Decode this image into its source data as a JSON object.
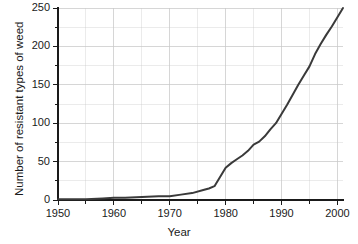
{
  "chart_data": {
    "type": "line",
    "title": "",
    "xlabel": "Year",
    "ylabel": "Number of resistant types of weed",
    "xlim": [
      1950,
      2001
    ],
    "ylim": [
      0,
      250
    ],
    "grid": true,
    "legend": null,
    "x_ticks": [
      1950,
      1960,
      1970,
      1980,
      1990,
      2000
    ],
    "x_tick_labels": [
      "1950",
      "1960",
      "1970",
      "1980",
      "1990",
      "2000"
    ],
    "x_minor_step": 5,
    "y_ticks": [
      0,
      50,
      100,
      150,
      200,
      250
    ],
    "y_tick_labels": [
      "0",
      "50",
      "100",
      "150",
      "200",
      "250"
    ],
    "y_minor_step": 25,
    "series": [
      {
        "name": "Resistant weed types",
        "color": "#3a3a3a",
        "line_width": 2,
        "x": [
          1950,
          1955,
          1958,
          1960,
          1962,
          1965,
          1968,
          1970,
          1972,
          1974,
          1976,
          1977,
          1978,
          1979,
          1980,
          1981,
          1982,
          1983,
          1984,
          1985,
          1986,
          1987,
          1988,
          1989,
          1990,
          1991,
          1992,
          1993,
          1994,
          1995,
          1996,
          1997,
          1998,
          1999,
          2000,
          2001
        ],
        "y": [
          1,
          1,
          2,
          3,
          3,
          4,
          5,
          5,
          7,
          9,
          13,
          15,
          18,
          30,
          42,
          48,
          53,
          58,
          64,
          72,
          76,
          83,
          92,
          100,
          112,
          124,
          137,
          150,
          162,
          174,
          190,
          203,
          215,
          226,
          238,
          250
        ]
      }
    ]
  },
  "axes_geometry": {
    "plot_left": 58,
    "plot_right": 343,
    "plot_top": 8,
    "plot_bottom": 200
  },
  "style": {
    "background": "#ffffff",
    "grid_color": "#c9c9c9",
    "axis_color": "#1a1a1a",
    "line_color": "#3a3a3a"
  }
}
